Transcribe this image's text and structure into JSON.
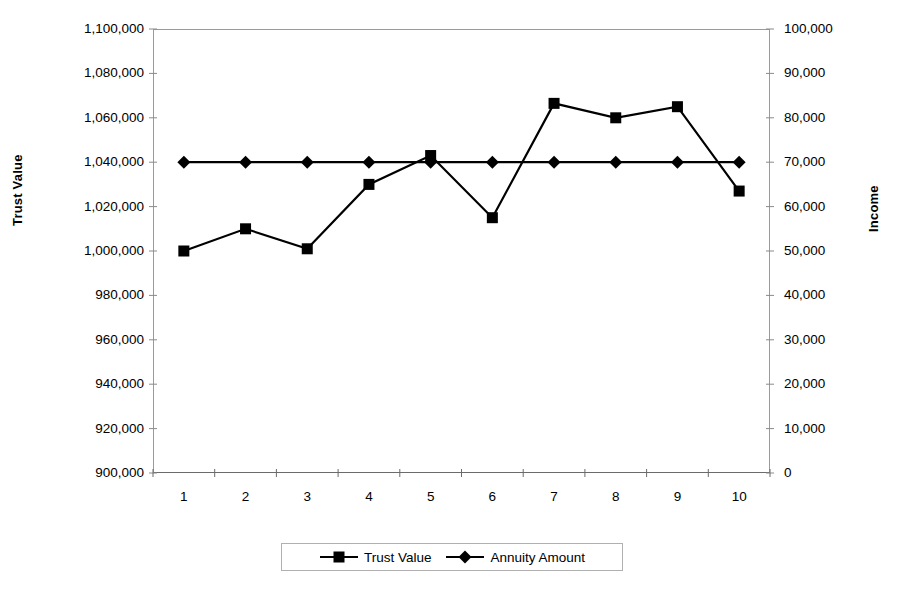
{
  "chart_data": {
    "type": "line",
    "title": "",
    "subtitle": "",
    "xlabel": "",
    "ylabel": "Trust Value",
    "y2label": "Income",
    "categories": [
      "1",
      "2",
      "3",
      "4",
      "5",
      "6",
      "7",
      "8",
      "9",
      "10"
    ],
    "x": [
      1,
      2,
      3,
      4,
      5,
      6,
      7,
      8,
      9,
      10
    ],
    "ylim": [
      900000,
      1100000
    ],
    "y2lim": [
      0,
      100000
    ],
    "ytick_labels": [
      "1,100,000",
      "1,080,000",
      "1,060,000",
      "1,040,000",
      "1,020,000",
      "1,000,000",
      "980,000",
      "960,000",
      "940,000",
      "920,000",
      "900,000"
    ],
    "ytick_values": [
      1100000,
      1080000,
      1060000,
      1040000,
      1020000,
      1000000,
      980000,
      960000,
      940000,
      920000,
      900000
    ],
    "y2tick_labels": [
      "100,000",
      "90,000",
      "80,000",
      "70,000",
      "60,000",
      "50,000",
      "40,000",
      "30,000",
      "20,000",
      "10,000",
      "0"
    ],
    "y2tick_values": [
      100000,
      90000,
      80000,
      70000,
      60000,
      50000,
      40000,
      30000,
      20000,
      10000,
      0
    ],
    "grid": false,
    "legend_position": "bottom",
    "series": [
      {
        "name": "Trust Value",
        "axis": "left",
        "marker": "square",
        "color": "#000000",
        "values": [
          1000000,
          1010000,
          1001000,
          1030000,
          1043000,
          1015000,
          1066500,
          1060000,
          1065000,
          1027000
        ]
      },
      {
        "name": "Annuity Amount",
        "axis": "right",
        "marker": "diamond",
        "color": "#000000",
        "values": [
          70000,
          70000,
          70000,
          70000,
          70000,
          70000,
          70000,
          70000,
          70000,
          70000
        ]
      }
    ]
  },
  "legend": {
    "entries": [
      {
        "label": "Trust Value",
        "marker": "square-marker"
      },
      {
        "label": "Annuity Amount",
        "marker": "diamond-marker"
      }
    ]
  }
}
